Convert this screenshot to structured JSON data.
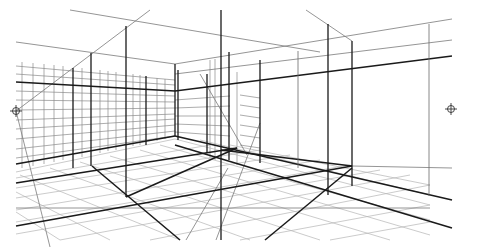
{
  "diagram": {
    "colors": {
      "background": "#ffffff",
      "bold": "#1a1a1a",
      "medium": "#4a4a4a",
      "light": "#9a9a9a",
      "faint": "#c4c4c4"
    },
    "vanishing_points": [
      {
        "name": "left-vanishing-point",
        "x": 16,
        "y": 111
      },
      {
        "name": "right-vanishing-point",
        "x": 451,
        "y": 109
      }
    ]
  }
}
